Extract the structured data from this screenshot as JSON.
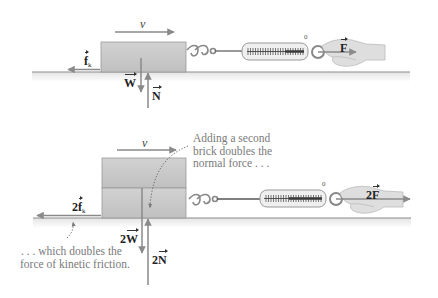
{
  "figure": {
    "type": "physics free-body diagram",
    "top_panel": {
      "velocity_label": "v",
      "friction_label": "f",
      "friction_subscript": "k",
      "weight_label": "W",
      "normal_label": "N",
      "applied_force_label": "F",
      "scale_zero_label": "0"
    },
    "bottom_panel": {
      "velocity_label": "v",
      "friction_coefficient": "2",
      "friction_label": "f",
      "friction_subscript": "k",
      "weight_coefficient": "2",
      "weight_label": "W",
      "normal_coefficient": "2",
      "normal_label": "N",
      "applied_force_coefficient": "2",
      "applied_force_label": "F",
      "scale_zero_label": "0",
      "annotation_top": [
        "Adding a second",
        "brick doubles the",
        "normal force . . ."
      ],
      "annotation_bottom": [
        ". . . which doubles the",
        "force of kinetic friction."
      ]
    },
    "colors": {
      "brick_fill": "#c6c6c6",
      "brick_edge": "#9a9a9a",
      "arrow": "#8a8a8a",
      "ground": "#8c8c8c",
      "hand": "#dcdcdc",
      "annotation_text": "#7a7a7a",
      "label_text": "#222222"
    }
  }
}
